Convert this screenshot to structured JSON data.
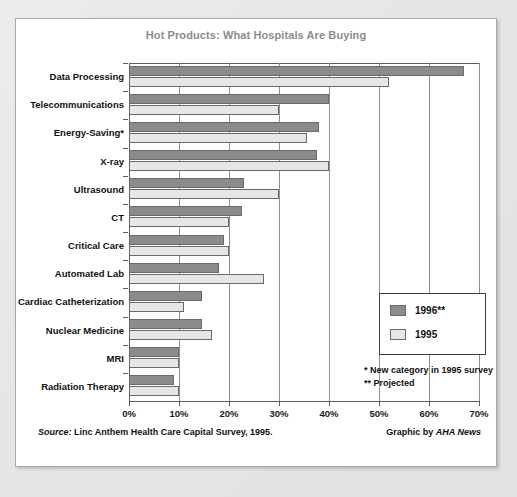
{
  "card": {
    "title": "Hot Products: What Hospitals Are Buying",
    "source_prefix": "Source:",
    "source_text": "Linc Anthem Health Care Capital Survey, 1995.",
    "credit_prefix": "Graphic by",
    "credit_name": "AHA News"
  },
  "legend": {
    "entries": [
      {
        "label": "1996**",
        "color": "#8b8b8b",
        "swatch": "dark"
      },
      {
        "label": "1995",
        "color": "#e6e6e4",
        "swatch": "light"
      }
    ]
  },
  "footnotes": [
    "* New category in 1995 survey",
    "** Projected"
  ],
  "chart_data": {
    "type": "bar",
    "orientation": "horizontal",
    "title": "Hot Products: What Hospitals Are Buying",
    "xlabel": "",
    "ylabel": "",
    "xlim": [
      0,
      70
    ],
    "xtick_labels": [
      "0%",
      "10%",
      "20%",
      "30%",
      "40%",
      "50%",
      "60%",
      "70%"
    ],
    "xticks": [
      0,
      10,
      20,
      30,
      40,
      50,
      60,
      70
    ],
    "grid": true,
    "legend_position": "right-inside",
    "categories": [
      "Data Processing",
      "Telecommunications",
      "Energy-Saving*",
      "X-ray",
      "Ultrasound",
      "CT",
      "Critical Care",
      "Automated Lab",
      "Cardiac Catheterization",
      "Nuclear Medicine",
      "MRI",
      "Radiation Therapy"
    ],
    "series": [
      {
        "name": "1996**",
        "color": "#8b8b8b",
        "values": [
          67,
          40,
          38,
          37.5,
          23,
          22.5,
          19,
          18,
          14.5,
          14.5,
          10,
          9
        ]
      },
      {
        "name": "1995",
        "color": "#e6e6e4",
        "values": [
          52,
          30,
          35.5,
          40,
          30,
          20,
          20,
          27,
          11,
          16.5,
          10,
          10
        ]
      }
    ]
  }
}
